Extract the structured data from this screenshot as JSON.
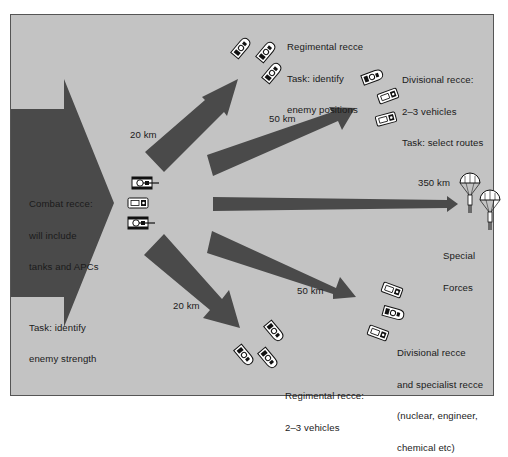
{
  "diagram": {
    "colors": {
      "background": "#c3c3c3",
      "arrow": "#4a4a4a",
      "frame_border": "#555555",
      "text": "#1a1a1a"
    },
    "main_arrow": {
      "label_line1": "Combat recce:",
      "label_line2": "will include",
      "label_line3": "tanks and APCs",
      "label_line4": "Task: identify",
      "label_line5": "enemy strength"
    },
    "arrows": [
      {
        "id": "upper-left",
        "distance": "20 km"
      },
      {
        "id": "upper-right",
        "distance": "50 km"
      },
      {
        "id": "center",
        "distance": "350 km"
      },
      {
        "id": "lower-right",
        "distance": "50 km"
      },
      {
        "id": "lower-left",
        "distance": "20 km"
      }
    ],
    "groups": {
      "regimental_top": {
        "line1": "Regimental recce",
        "line2": "Task: identify",
        "line3": "enemy positions"
      },
      "divisional_top": {
        "line1": "Divisional recce:",
        "line2": "2–3 vehicles",
        "line3": "Task: select routes"
      },
      "special_forces": {
        "line1": "Special",
        "line2": "Forces"
      },
      "divisional_bottom": {
        "line1": "Divisional recce",
        "line2": "and specialist recce",
        "line3": "(nuclear, engineer,",
        "line4": "chemical etc)"
      },
      "regimental_bottom": {
        "line1": "Regimental recce:",
        "line2": "2–3 vehicles"
      }
    },
    "icons": {
      "combat_vehicles": [
        "tank-icon",
        "apc-icon",
        "tank-icon"
      ],
      "regimental_top_vehicles": [
        "recce-vehicle-icon",
        "recce-vehicle-icon",
        "recce-vehicle-icon"
      ],
      "divisional_top_vehicles": [
        "recce-vehicle-icon",
        "apc-icon",
        "apc-icon"
      ],
      "special_forces": [
        "parachute-icon",
        "parachute-icon"
      ],
      "divisional_bottom_vehicles": [
        "apc-icon",
        "recce-vehicle-icon",
        "apc-icon"
      ],
      "regimental_bottom_vehicles": [
        "recce-vehicle-icon",
        "recce-vehicle-icon",
        "recce-vehicle-icon"
      ]
    }
  }
}
